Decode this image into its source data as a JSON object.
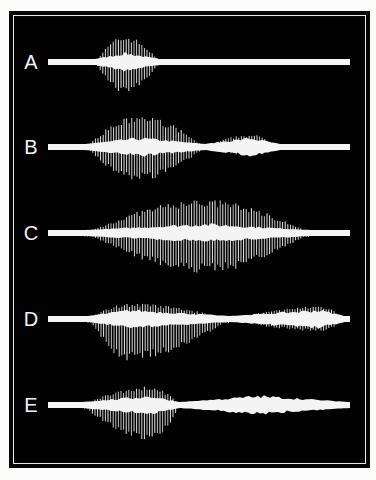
{
  "figure": {
    "background": "#050505",
    "trace_color": "#f4f4f4",
    "frame_line_color": "#e8e8e8",
    "traces": [
      {
        "label": "A",
        "baseline_y": 62,
        "segments": [
          {
            "x0": 48,
            "x1": 95,
            "up": 3,
            "down": 3
          },
          {
            "x0": 95,
            "x1": 160,
            "up": 25,
            "down": 30,
            "peak_x": 125
          },
          {
            "x0": 160,
            "x1": 350,
            "up": 3,
            "down": 3
          }
        ]
      },
      {
        "label": "B",
        "baseline_y": 147,
        "segments": [
          {
            "x0": 48,
            "x1": 85,
            "up": 3,
            "down": 3
          },
          {
            "x0": 85,
            "x1": 205,
            "up": 30,
            "down": 32,
            "peak_x": 140
          },
          {
            "x0": 205,
            "x1": 280,
            "up": 12,
            "down": 8,
            "peak_x": 250
          },
          {
            "x0": 280,
            "x1": 350,
            "up": 3,
            "down": 3
          }
        ]
      },
      {
        "label": "C",
        "baseline_y": 233,
        "segments": [
          {
            "x0": 48,
            "x1": 85,
            "up": 3,
            "down": 3
          },
          {
            "x0": 85,
            "x1": 310,
            "up": 32,
            "down": 38,
            "peak_x": 205
          },
          {
            "x0": 310,
            "x1": 350,
            "up": 3,
            "down": 3
          }
        ]
      },
      {
        "label": "D",
        "baseline_y": 319,
        "segments": [
          {
            "x0": 48,
            "x1": 88,
            "up": 3,
            "down": 3
          },
          {
            "x0": 88,
            "x1": 230,
            "up": 15,
            "down": 40,
            "peak_x": 130
          },
          {
            "x0": 230,
            "x1": 345,
            "up": 12,
            "down": 12,
            "peak_x": 320
          },
          {
            "x0": 345,
            "x1": 350,
            "up": 3,
            "down": 3
          }
        ]
      },
      {
        "label": "E",
        "baseline_y": 405,
        "segments": [
          {
            "x0": 48,
            "x1": 82,
            "up": 3,
            "down": 3
          },
          {
            "x0": 82,
            "x1": 180,
            "up": 18,
            "down": 35,
            "peak_x": 150
          },
          {
            "x0": 180,
            "x1": 350,
            "up": 6,
            "down": 6,
            "peak_x": 260
          }
        ]
      }
    ]
  }
}
